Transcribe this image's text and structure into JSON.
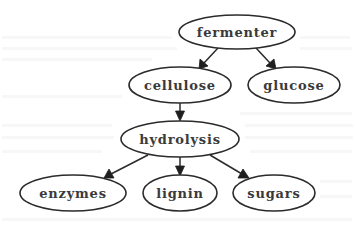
{
  "diagram": {
    "type": "directed-graph",
    "title": "",
    "style": {
      "background": "#ffffff",
      "node_fill": "#ffffff",
      "node_stroke": "#2b2b2b",
      "text_color": "#3a3a3a",
      "edge_color": "#2b2b2b"
    },
    "nodes": [
      {
        "id": "fermenter",
        "label": "fermenter",
        "shape": "ellipse",
        "cx": 237,
        "cy": 32,
        "rx": 58,
        "ry": 17
      },
      {
        "id": "cellulose",
        "label": "cellulose",
        "shape": "ellipse",
        "cx": 180,
        "cy": 85,
        "rx": 51,
        "ry": 18
      },
      {
        "id": "glucose",
        "label": "glucose",
        "shape": "ellipse",
        "cx": 294,
        "cy": 85,
        "rx": 46,
        "ry": 18
      },
      {
        "id": "hydrolysis",
        "label": "hydrolysis",
        "shape": "ellipse",
        "cx": 180,
        "cy": 139,
        "rx": 59,
        "ry": 18
      },
      {
        "id": "enzymes",
        "label": "enzymes",
        "shape": "ellipse",
        "cx": 73,
        "cy": 193,
        "rx": 53,
        "ry": 18
      },
      {
        "id": "lignin",
        "label": "lignin",
        "shape": "ellipse",
        "cx": 180,
        "cy": 193,
        "rx": 37,
        "ry": 18
      },
      {
        "id": "sugars",
        "label": "sugars",
        "shape": "ellipse",
        "cx": 274,
        "cy": 193,
        "rx": 41,
        "ry": 18
      }
    ],
    "edges": [
      {
        "from": "fermenter",
        "to": "cellulose"
      },
      {
        "from": "fermenter",
        "to": "glucose"
      },
      {
        "from": "cellulose",
        "to": "hydrolysis"
      },
      {
        "from": "hydrolysis",
        "to": "enzymes"
      },
      {
        "from": "hydrolysis",
        "to": "lignin"
      },
      {
        "from": "hydrolysis",
        "to": "sugars"
      }
    ]
  }
}
